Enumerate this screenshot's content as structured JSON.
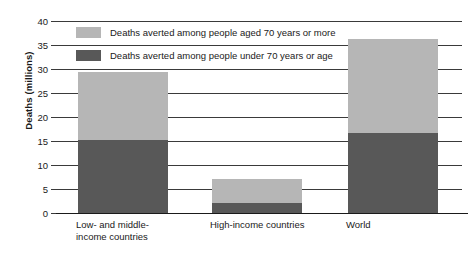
{
  "chart_data": {
    "type": "bar",
    "subtype": "stacked-bar",
    "title": "",
    "xlabel": "",
    "ylabel": "Deaths (millions)",
    "ylim": [
      0,
      40
    ],
    "yticks": [
      0,
      5,
      10,
      15,
      20,
      25,
      30,
      35,
      40
    ],
    "ytick_labels": [
      "0",
      "5",
      "10",
      "15",
      "20",
      "25",
      "30",
      "35",
      "40"
    ],
    "grid": true,
    "legend_position": "upper-left-inside",
    "categories": [
      "Low- and middle-income countries",
      "High-income countries",
      "World"
    ],
    "category_label_lines": [
      [
        "Low- and middle-",
        "income countries"
      ],
      [
        "High-income countries"
      ],
      [
        "World"
      ]
    ],
    "series": [
      {
        "name": "Deaths averted among people under 70 years or age",
        "color": "#585858",
        "values": [
          15.2,
          2.0,
          16.6
        ]
      },
      {
        "name": "Deaths averted among people aged 70 years or more",
        "color": "#b6b6b6",
        "values": [
          14.1,
          5.1,
          19.6
        ]
      }
    ],
    "totals": [
      29.3,
      7.1,
      36.2
    ]
  },
  "axis": {
    "y_title": "Deaths (millions)"
  },
  "legend": {
    "items": [
      {
        "label": "Deaths averted among people aged 70 years or more",
        "color": "#b6b6b6",
        "swatch": "legend-swatch-upper"
      },
      {
        "label": "Deaths averted among people under 70 years or age",
        "color": "#585858",
        "swatch": "legend-swatch-lower"
      }
    ]
  }
}
